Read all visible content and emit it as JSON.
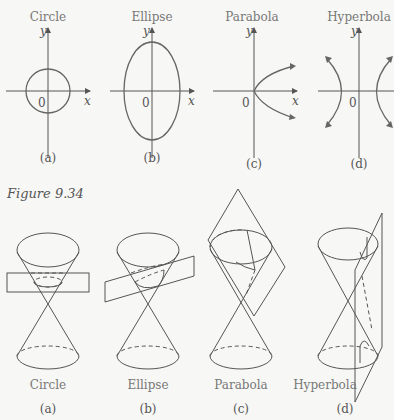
{
  "top_row": {
    "panels": [
      {
        "title": "Circle",
        "label": "(a)",
        "y_axis": "y",
        "x_axis": "x",
        "origin": "0"
      },
      {
        "title": "Ellipse",
        "label": "(b)",
        "y_axis": "y",
        "x_axis": "x",
        "origin": "0"
      },
      {
        "title": "Parabola",
        "label": "(c)",
        "y_axis": "y",
        "x_axis": "x",
        "origin": "0"
      },
      {
        "title": "Hyperbola",
        "label": "(d)",
        "y_axis": "y",
        "x_axis": "x",
        "origin": "0"
      }
    ]
  },
  "figure_caption": "Figure 9.34",
  "bottom_row": {
    "panels": [
      {
        "name": "Circle",
        "label": "(a)"
      },
      {
        "name": "Ellipse",
        "label": "(b)"
      },
      {
        "name": "Parabola",
        "label": "(c)"
      },
      {
        "name": "Hyperbola",
        "label": "(d)"
      }
    ]
  },
  "colors": {
    "background": "#f7f7f5",
    "line": "#555555",
    "text": "#555555"
  }
}
